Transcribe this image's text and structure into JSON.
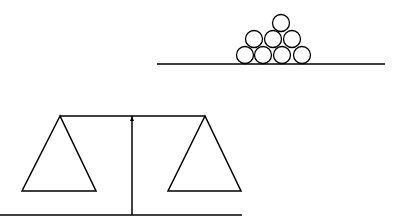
{
  "diagram": {
    "stroke_color": "#000000",
    "background": "#ffffff",
    "stack": {
      "baseline": {
        "x1": 157,
        "x2": 385,
        "y": 64
      },
      "radius": 8.5,
      "circles": [
        {
          "cx": 281,
          "cy": 23
        },
        {
          "cx": 254,
          "cy": 39
        },
        {
          "cx": 273,
          "cy": 39
        },
        {
          "cx": 292,
          "cy": 39
        },
        {
          "cx": 245,
          "cy": 55
        },
        {
          "cx": 263,
          "cy": 55
        },
        {
          "cx": 282,
          "cy": 55
        },
        {
          "cx": 302,
          "cy": 55
        }
      ]
    },
    "balance": {
      "ground": {
        "x1": 0,
        "x2": 242,
        "y": 215
      },
      "pole": {
        "x": 132,
        "y1": 215,
        "y2": 116
      },
      "beam": {
        "x1": 60,
        "x2": 205,
        "y": 116
      },
      "left_pan": {
        "apex": [
          60,
          116
        ],
        "base_left": [
          22,
          191
        ],
        "base_right": [
          96,
          191
        ]
      },
      "right_pan": {
        "apex": [
          205,
          116
        ],
        "base_left": [
          168,
          191
        ],
        "base_right": [
          241,
          191
        ]
      }
    }
  }
}
